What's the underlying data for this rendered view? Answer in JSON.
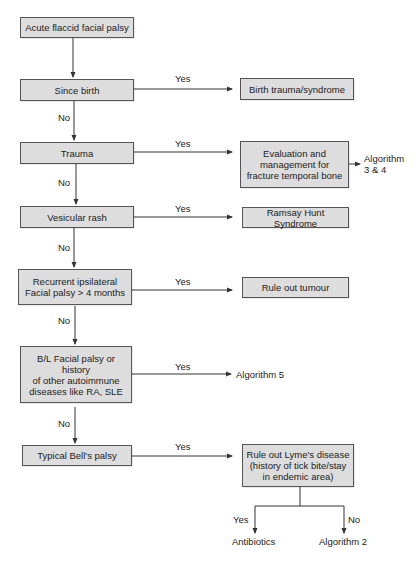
{
  "diagram": {
    "type": "flowchart",
    "nodes": {
      "start": "Acute flaccid facial palsy",
      "since_birth": "Since birth",
      "birth_trauma": "Birth trauma/syndrome",
      "trauma": "Trauma",
      "evaluation": "Evaluation and management for fracture temporal bone",
      "algorithm_3_4": "Algorithm 3 & 4",
      "vesicular_rash": "Vesicular rash",
      "ramsay_hunt": "Ramsay Hunt Syndrome",
      "recurrent": "Recurrent ipsilateral Facial palsy > 4 months",
      "rule_out_tumour": "Rule out tumour",
      "bilateral": "B/L Facial palsy or history of other autoimmune diseases like RA, SLE",
      "algorithm_5": "Algorithm 5",
      "typical_bells": "Typical Bell's palsy",
      "lyme": "Rule out Lyme's disease (history of tick bite/stay in endemic area)",
      "antibiotics": "Antibiotics",
      "algorithm_2": "Algorithm 2"
    },
    "lines": {
      "evaluation": [
        "Evaluation and",
        "management for",
        "fracture temporal bone"
      ],
      "algorithm_3_4": [
        "Algorithm",
        "3 & 4"
      ],
      "recurrent": [
        "Recurrent ipsilateral",
        "Facial palsy > 4 months"
      ],
      "bilateral": [
        "B/L Facial palsy or history",
        "of other autoimmune",
        "diseases like RA, SLE"
      ],
      "lyme": [
        "Rule out Lyme's disease",
        "(history of tick bite/stay",
        "in endemic area)"
      ]
    },
    "edge_labels": {
      "yes": "Yes",
      "no": "No"
    },
    "edges": [
      {
        "from": "start",
        "to": "since_birth",
        "label": ""
      },
      {
        "from": "since_birth",
        "to": "birth_trauma",
        "label": "Yes"
      },
      {
        "from": "since_birth",
        "to": "trauma",
        "label": "No"
      },
      {
        "from": "trauma",
        "to": "evaluation",
        "label": "Yes"
      },
      {
        "from": "evaluation",
        "to": "algorithm_3_4",
        "label": ""
      },
      {
        "from": "trauma",
        "to": "vesicular_rash",
        "label": "No"
      },
      {
        "from": "vesicular_rash",
        "to": "ramsay_hunt",
        "label": "Yes"
      },
      {
        "from": "vesicular_rash",
        "to": "recurrent",
        "label": "No"
      },
      {
        "from": "recurrent",
        "to": "rule_out_tumour",
        "label": "Yes"
      },
      {
        "from": "recurrent",
        "to": "bilateral",
        "label": "No"
      },
      {
        "from": "bilateral",
        "to": "algorithm_5",
        "label": "Yes"
      },
      {
        "from": "bilateral",
        "to": "typical_bells",
        "label": "No"
      },
      {
        "from": "typical_bells",
        "to": "lyme",
        "label": "Yes"
      },
      {
        "from": "lyme",
        "to": "antibiotics",
        "label": "Yes"
      },
      {
        "from": "lyme",
        "to": "algorithm_2",
        "label": "No"
      }
    ],
    "colors": {
      "box_fill": "#dddddd",
      "box_border": "#555555",
      "line": "#333333",
      "text": "#222222"
    }
  }
}
